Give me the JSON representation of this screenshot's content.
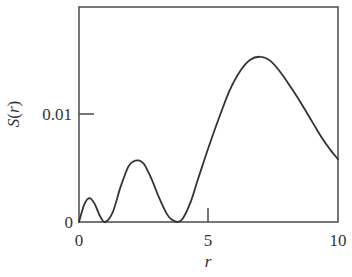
{
  "chart_data": {
    "type": "line",
    "title": "",
    "xlabel": "r",
    "ylabel": "S(r)",
    "xlim": [
      0,
      10
    ],
    "ylim": [
      0,
      0.02
    ],
    "grid": false,
    "legend": null,
    "x_ticks": [
      {
        "value": 0,
        "label": "0"
      },
      {
        "value": 5,
        "label": "5"
      },
      {
        "value": 10,
        "label": "10"
      }
    ],
    "y_ticks": [
      {
        "value": 0,
        "label": "0"
      },
      {
        "value": 0.01,
        "label": "0.01"
      }
    ],
    "series": [
      {
        "name": "S(r)",
        "color": "#333333",
        "x": [
          0,
          0.2,
          0.4,
          0.6,
          0.8,
          1.0,
          1.3,
          1.6,
          1.9,
          2.1,
          2.3,
          2.5,
          2.8,
          3.1,
          3.4,
          3.6,
          3.8,
          4.0,
          4.3,
          4.6,
          5.0,
          5.4,
          5.8,
          6.2,
          6.6,
          7.0,
          7.4,
          7.8,
          8.2,
          8.6,
          9.0,
          9.4,
          9.7,
          10.0
        ],
        "values": [
          0,
          0.0016,
          0.0022,
          0.0017,
          0.0006,
          0,
          0.0009,
          0.0032,
          0.0051,
          0.0056,
          0.0057,
          0.0054,
          0.004,
          0.0022,
          0.0007,
          0.0002,
          0,
          0.0003,
          0.0018,
          0.004,
          0.0069,
          0.0096,
          0.0121,
          0.0139,
          0.015,
          0.0153,
          0.0149,
          0.0138,
          0.0124,
          0.0109,
          0.0093,
          0.0077,
          0.0067,
          0.0058
        ]
      }
    ]
  },
  "labels": {
    "xlabel": "r",
    "ylabel_s": "S",
    "ylabel_open": "(",
    "ylabel_r": "r",
    "ylabel_close": ")",
    "xtick_0": "0",
    "xtick_5": "5",
    "xtick_10": "10",
    "ytick_0": "0",
    "ytick_001": "0.01"
  }
}
